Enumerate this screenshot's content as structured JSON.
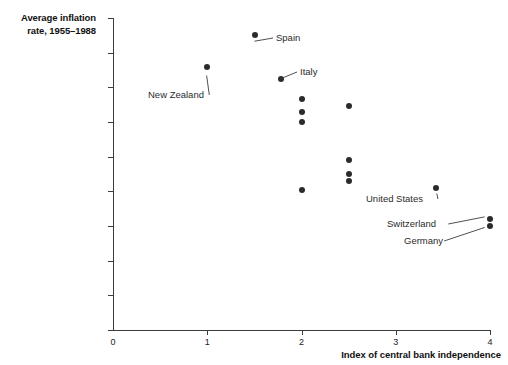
{
  "chart_data": {
    "type": "scatter",
    "title": "",
    "xlabel": "Index of central bank independence",
    "ylabel": "Average inflation rate, 1955–1988",
    "ylabel_line1": "Average inflation",
    "ylabel_line2": "rate, 1955–1988",
    "xlim": [
      0,
      4
    ],
    "ylim": [
      0,
      9
    ],
    "xticks": [
      0,
      1,
      2,
      3,
      4
    ],
    "xtick_labels": [
      "0",
      "1",
      "2",
      "3",
      "4"
    ],
    "yticks": [
      0,
      1,
      2,
      3,
      4,
      5,
      6,
      7,
      8,
      9
    ],
    "ytick_labels": [
      "0",
      "1",
      "2",
      "3",
      "4",
      "5",
      "6",
      "7",
      "8",
      "9%"
    ],
    "grid": false,
    "legend": false,
    "marker_color": "#2b2b2b",
    "axis_color": "#3c3c3c",
    "points": [
      {
        "x": 1.51,
        "y": 8.5,
        "label": "Spain"
      },
      {
        "x": 1.0,
        "y": 7.6,
        "label": "New Zealand"
      },
      {
        "x": 1.78,
        "y": 7.25,
        "label": "Italy"
      },
      {
        "x": 2.0,
        "y": 6.65,
        "label": ""
      },
      {
        "x": 2.0,
        "y": 6.3,
        "label": ""
      },
      {
        "x": 2.0,
        "y": 6.0,
        "label": ""
      },
      {
        "x": 2.5,
        "y": 6.45,
        "label": ""
      },
      {
        "x": 2.5,
        "y": 4.9,
        "label": ""
      },
      {
        "x": 2.5,
        "y": 4.5,
        "label": ""
      },
      {
        "x": 2.5,
        "y": 4.3,
        "label": ""
      },
      {
        "x": 2.0,
        "y": 4.05,
        "label": ""
      },
      {
        "x": 3.43,
        "y": 4.1,
        "label": "United States"
      },
      {
        "x": 4.0,
        "y": 3.2,
        "label": "Switzerland"
      },
      {
        "x": 4.0,
        "y": 3.0,
        "label": "Germany"
      }
    ],
    "annotations": [
      {
        "text": "Spain",
        "x": 276,
        "y": 32,
        "point_x": 250,
        "point_y": 42
      },
      {
        "text": "New Zealand",
        "x": 148,
        "y": 89,
        "point_x": 206,
        "point_y": 71
      },
      {
        "text": "Italy",
        "x": 300,
        "y": 66,
        "point_x": 275,
        "point_y": 81
      },
      {
        "text": "United States",
        "x": 366,
        "y": 193,
        "point_x": 436,
        "point_y": 189
      },
      {
        "text": "Switzerland",
        "x": 387,
        "y": 218,
        "point_x": 489,
        "point_y": 216
      },
      {
        "text": "Germany",
        "x": 404,
        "y": 235,
        "point_x": 489,
        "point_y": 226
      }
    ]
  }
}
